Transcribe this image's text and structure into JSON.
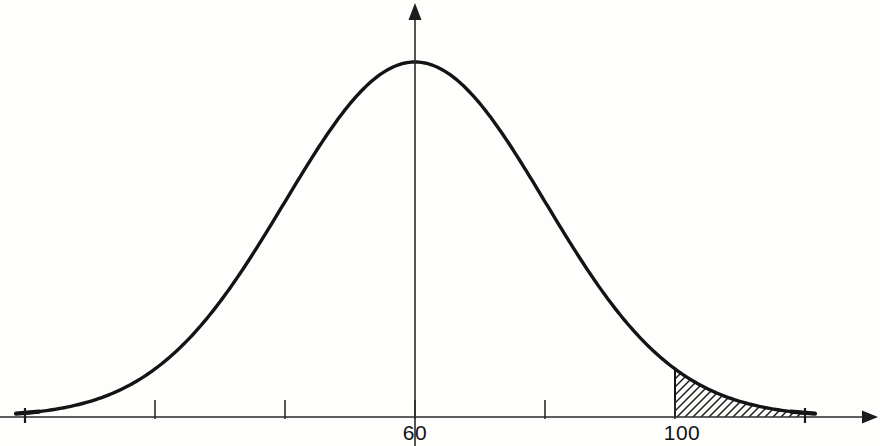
{
  "figure": {
    "background_color": "#fefefd",
    "curve_color": "#141414",
    "axis_color": "#2b2b2b",
    "hatch_color": "#1d1d1d"
  },
  "axes": {
    "x_axis_name": "horizontal-axis",
    "y_axis_name": "vertical-axis",
    "x_axis_has_arrow": true,
    "y_axis_has_arrow": true,
    "x_axis_label": "",
    "y_axis_label": ""
  },
  "tick_labels": [
    {
      "value": "60",
      "x": 415
    },
    {
      "value": "100",
      "x": 682
    }
  ],
  "chart_data": {
    "type": "line",
    "subtitle": "",
    "xlabel": "",
    "ylabel": "",
    "grid": false,
    "legend": "none",
    "distribution": "normal",
    "mean": 60,
    "std_dev": 20,
    "xlim": [
      0,
      120
    ],
    "ylim": [
      0,
      1
    ],
    "x_tick_positions": [
      0,
      20,
      40,
      60,
      80,
      100,
      120
    ],
    "x_tick_labels": [
      "",
      "",
      "",
      "60",
      "",
      "100",
      ""
    ],
    "labeled_ticks": [
      60,
      100
    ],
    "peak_value": 60,
    "shaded_region": {
      "label": "",
      "from": 100,
      "to": 120,
      "fill": "diagonal-hatch",
      "hatch_angle_deg": 45,
      "hatch_spacing_px": 8
    },
    "x": [
      0,
      5,
      10,
      15,
      20,
      25,
      30,
      35,
      40,
      45,
      50,
      55,
      60,
      65,
      70,
      75,
      80,
      85,
      90,
      95,
      100,
      105,
      110,
      115,
      120
    ],
    "y": [
      0.011,
      0.022,
      0.044,
      0.079,
      0.135,
      0.217,
      0.325,
      0.457,
      0.607,
      0.756,
      0.882,
      0.969,
      1.0,
      0.969,
      0.882,
      0.756,
      0.607,
      0.457,
      0.325,
      0.217,
      0.135,
      0.079,
      0.044,
      0.022,
      0.011
    ]
  }
}
